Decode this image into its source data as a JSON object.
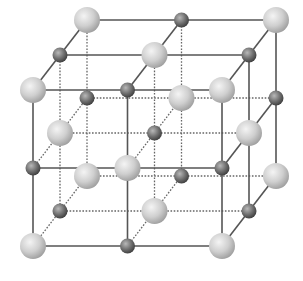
{
  "diagram": {
    "type": "crystal-lattice",
    "grid_size": 3,
    "origin": [
      33,
      246
    ],
    "x_step": 94.5,
    "y_step": 78,
    "depth_step": [
      27,
      -35
    ],
    "atoms": {
      "large": {
        "radius": 13,
        "color": "#c8c8c8",
        "highlight": "#f2f2f2",
        "shade": "#9a9a9a"
      },
      "small": {
        "radius": 7.5,
        "color": "#6e6e6e",
        "highlight": "#b0b0b0",
        "shade": "#3c3c3c"
      }
    },
    "lines": {
      "solid_color": "#555555",
      "dotted_color": "#666666"
    }
  }
}
